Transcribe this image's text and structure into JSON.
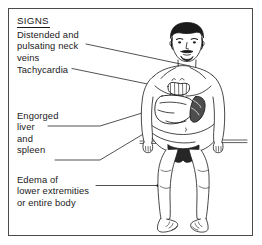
{
  "panel": {
    "heading": "SIGNS",
    "border_color": "#4a4a4a",
    "background_color": "#ffffff",
    "text_color": "#1a1a1a"
  },
  "labels": {
    "neck_veins": "Distended and\npulsating neck\nveins",
    "tachycardia": "Tachycardia",
    "engorged_organs": "Engorged\nliver\nand\nspleen",
    "edema": "Edema of\nlower extremities\nor entire body"
  },
  "illustration": {
    "subject": "seated-male-patient",
    "description": "Front view of a seated bare-chested man with beard and mustache, legs hanging over the edge of an examination table, with heart, liver and spleen drawn on the torso",
    "organs": [
      "heart",
      "liver",
      "spleen"
    ],
    "line_color": "#1a1a1a",
    "skin_fill": "#ffffff",
    "hair_fill": "#1a1a1a",
    "spleen_fill": "#4d4d4d",
    "brief_fill": "#262626"
  },
  "callouts": [
    {
      "target": "neck",
      "label_key": "neck_veins"
    },
    {
      "target": "heart",
      "label_key": "tachycardia"
    },
    {
      "target": "liver",
      "label_key": "engorged_organs"
    },
    {
      "target": "spleen",
      "label_key": "engorged_organs"
    },
    {
      "target": "left-ankle",
      "label_key": "edema"
    }
  ]
}
